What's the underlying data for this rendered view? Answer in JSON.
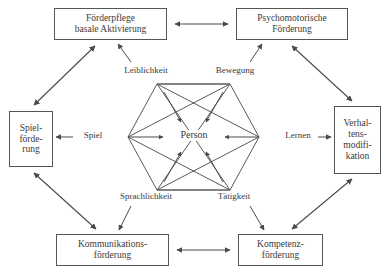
{
  "diagram": {
    "stroke_color": "#555555",
    "text_color": "#3a3a3a",
    "background": "#ffffff",
    "center": {
      "label": "Person"
    },
    "hexagon_labels": {
      "top_left": "Leiblichkeit",
      "top_right": "Bewegung",
      "left": "Spiel",
      "right": "Lernen",
      "bottom_left": "Sprachlichkeit",
      "bottom_right": "Tätigkeit"
    },
    "boxes": {
      "top_left": "Förderpflege\nbasale Aktivierung",
      "top_right": "Psychomotorische\nFörderung",
      "left": "Spiel-\nförde-\nrung",
      "right": "Verhal-\ntens-\nmodifi-\nkation",
      "bottom_left": "Kommunikations-\nförderung",
      "bottom_right": "Kompetenz-\nförderung"
    },
    "connectors": [
      {
        "name": "top-horizontal",
        "from": "Förderpflege basale Aktivierung",
        "to": "Psychomotorische Förderung",
        "style": "double-arrow"
      },
      {
        "name": "bottom-horizontal",
        "from": "Kommunikationsförderung",
        "to": "Kompetenzförderung",
        "style": "double-arrow"
      },
      {
        "name": "upper-left-diagonal",
        "from": "Spielförderung",
        "to": "Förderpflege basale Aktivierung",
        "style": "double-arrow"
      },
      {
        "name": "upper-right-diagonal",
        "from": "Psychomotorische Förderung",
        "to": "Verhaltensmodifikation",
        "style": "double-arrow"
      },
      {
        "name": "lower-left-diagonal",
        "from": "Spielförderung",
        "to": "Kommunikationsförderung",
        "style": "double-arrow"
      },
      {
        "name": "lower-right-diagonal",
        "from": "Kompetenzförderung",
        "to": "Verhaltensmodifikation",
        "style": "double-arrow"
      },
      {
        "name": "spiel-to-spielfoerderung",
        "from": "Spiel",
        "to": "Spielförderung",
        "style": "single-arrow"
      },
      {
        "name": "lernen-to-verhaltensmodifikation",
        "from": "Lernen",
        "to": "Verhaltensmodifikation",
        "style": "single-arrow"
      },
      {
        "name": "leiblichkeit-to-foerderpflege",
        "from": "Leiblichkeit",
        "to": "Förderpflege basale Aktivierung",
        "style": "single-arrow"
      },
      {
        "name": "bewegung-to-psychomotorische",
        "from": "Bewegung",
        "to": "Psychomotorische Förderung",
        "style": "single-arrow"
      },
      {
        "name": "sprachlichkeit-to-kommunikation",
        "from": "Sprachlichkeit",
        "to": "Kommunikationsförderung",
        "style": "single-arrow"
      },
      {
        "name": "taetigkeit-to-kompetenz",
        "from": "Tätigkeit",
        "to": "Kompetenzförderung",
        "style": "single-arrow"
      },
      {
        "name": "vertices-to-person",
        "from": "all hexagon vertices",
        "to": "Person",
        "style": "single-arrow"
      }
    ]
  }
}
